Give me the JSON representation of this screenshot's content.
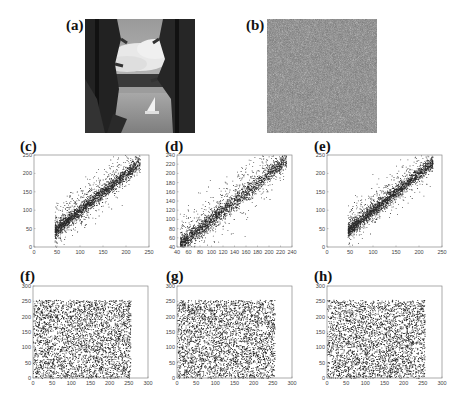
{
  "figure": {
    "panels": {
      "a": {
        "label": "(a)",
        "type": "image",
        "description": "Original grayscale image: lake with sailboat framed by pine trees"
      },
      "b": {
        "label": "(b)",
        "type": "image",
        "description": "Encrypted image: uniform gray noise"
      },
      "c": {
        "label": "(c)"
      },
      "d": {
        "label": "(d)"
      },
      "e": {
        "label": "(e)"
      },
      "f": {
        "label": "(f)"
      },
      "g": {
        "label": "(g)"
      },
      "h": {
        "label": "(h)"
      }
    },
    "colors": {
      "point": "#2a2a2a",
      "axis": "#888888",
      "background": "#ffffff"
    }
  },
  "chart_data": [
    {
      "panel": "c",
      "type": "scatter",
      "title": "",
      "xlabel": "",
      "ylabel": "",
      "xlim": [
        0,
        250
      ],
      "ylim": [
        0,
        250
      ],
      "xticks": [
        0,
        50,
        100,
        150,
        200,
        250
      ],
      "yticks": [
        0,
        50,
        100,
        150,
        200,
        250
      ],
      "pattern": "correlated",
      "trend": {
        "x_range": [
          45,
          230
        ],
        "slope": 1.0,
        "intercept": 0
      },
      "grid": false
    },
    {
      "panel": "d",
      "type": "scatter",
      "title": "",
      "xlabel": "",
      "ylabel": "",
      "xlim": [
        40,
        240
      ],
      "ylim": [
        40,
        240
      ],
      "xticks": [
        40,
        60,
        80,
        100,
        120,
        140,
        160,
        180,
        200,
        220,
        240
      ],
      "yticks": [
        40,
        60,
        80,
        100,
        120,
        140,
        160,
        180,
        200,
        220,
        240
      ],
      "pattern": "correlated",
      "trend": {
        "x_range": [
          45,
          230
        ],
        "slope": 1.0,
        "intercept": 0
      },
      "grid": false
    },
    {
      "panel": "e",
      "type": "scatter",
      "title": "",
      "xlabel": "",
      "ylabel": "",
      "xlim": [
        0,
        250
      ],
      "ylim": [
        0,
        250
      ],
      "xticks": [
        0,
        50,
        100,
        150,
        200,
        250
      ],
      "yticks": [
        0,
        50,
        100,
        150,
        200,
        250
      ],
      "pattern": "correlated",
      "trend": {
        "x_range": [
          45,
          230
        ],
        "slope": 1.0,
        "intercept": 0
      },
      "grid": false
    },
    {
      "panel": "f",
      "type": "scatter",
      "title": "",
      "xlabel": "",
      "ylabel": "",
      "xlim": [
        0,
        300
      ],
      "ylim": [
        0,
        300
      ],
      "xticks": [
        0,
        50,
        100,
        150,
        200,
        250,
        300
      ],
      "yticks": [
        0,
        50,
        100,
        150,
        200,
        250,
        300
      ],
      "pattern": "uniform",
      "range": [
        0,
        255
      ],
      "grid": false
    },
    {
      "panel": "g",
      "type": "scatter",
      "title": "",
      "xlabel": "",
      "ylabel": "",
      "xlim": [
        0,
        300
      ],
      "ylim": [
        0,
        300
      ],
      "xticks": [
        0,
        50,
        100,
        150,
        200,
        250,
        300
      ],
      "yticks": [
        0,
        50,
        100,
        150,
        200,
        250,
        300
      ],
      "pattern": "uniform",
      "range": [
        0,
        255
      ],
      "grid": false
    },
    {
      "panel": "h",
      "type": "scatter",
      "title": "",
      "xlabel": "",
      "ylabel": "",
      "xlim": [
        0,
        300
      ],
      "ylim": [
        0,
        300
      ],
      "xticks": [
        0,
        50,
        100,
        150,
        200,
        250,
        300
      ],
      "yticks": [
        0,
        50,
        100,
        150,
        200,
        250,
        300
      ],
      "pattern": "uniform",
      "range": [
        0,
        255
      ],
      "grid": false
    }
  ]
}
